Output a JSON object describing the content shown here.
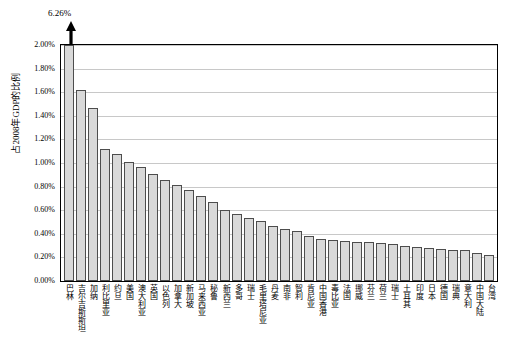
{
  "chart_data": {
    "type": "bar",
    "title": "",
    "xlabel": "",
    "ylabel": "占2008年GDP的比例",
    "ylim": [
      0,
      0.02
    ],
    "grid": true,
    "legend": null,
    "y_ticks": [
      "0.00%",
      "0.20%",
      "0.40%",
      "0.60%",
      "0.80%",
      "1.00%",
      "1.20%",
      "1.40%",
      "1.60%",
      "1.80%",
      "2.00%"
    ],
    "y_tick_values": [
      0,
      0.002,
      0.004,
      0.006,
      0.008,
      0.01,
      0.012,
      0.014,
      0.016,
      0.018,
      0.02
    ],
    "annotations": [
      {
        "text": "6.26%",
        "target_category": "巴林",
        "note": "bar truncated by axis maximum, arrow points up"
      }
    ],
    "categories": [
      "巴林",
      "吉尔吉斯斯坦",
      "加纳",
      "利比里亚",
      "约旦",
      "美国",
      "澳大利亚",
      "英国",
      "以色列",
      "加拿大",
      "新加坡",
      "马来西亚",
      "秘鲁",
      "新西兰",
      "多哥",
      "瑞士",
      "毛里塔尼亚",
      "丹麦",
      "南非",
      "智利",
      "肯尼亚",
      "中国香港",
      "毒比亚",
      "法国",
      "挪威",
      "芬兰",
      "荷兰",
      "瑞士",
      "土耳其",
      "印度",
      "日本",
      "德国",
      "瑞典",
      "意大利",
      "中国大陆",
      "台湾"
    ],
    "values": [
      0.0626,
      0.0162,
      0.0147,
      0.0112,
      0.0108,
      0.0101,
      0.0097,
      0.0091,
      0.0086,
      0.0081,
      0.0077,
      0.0072,
      0.0067,
      0.006,
      0.0057,
      0.0053,
      0.0051,
      0.0047,
      0.0044,
      0.0042,
      0.0038,
      0.0036,
      0.0035,
      0.0034,
      0.0033,
      0.0033,
      0.0032,
      0.0031,
      0.003,
      0.0029,
      0.0028,
      0.0027,
      0.0026,
      0.0026,
      0.0024,
      0.0022
    ],
    "value_labels": [
      "6.26%",
      "1.62%",
      "1.47%",
      "1.12%",
      "1.08%",
      "1.01%",
      "0.97%",
      "0.91%",
      "0.86%",
      "0.81%",
      "0.77%",
      "0.72%",
      "0.67%",
      "0.60%",
      "0.57%",
      "0.53%",
      "0.51%",
      "0.47%",
      "0.44%",
      "0.42%",
      "0.38%",
      "0.36%",
      "0.35%",
      "0.34%",
      "0.33%",
      "0.33%",
      "0.32%",
      "0.31%",
      "0.30%",
      "0.29%",
      "0.28%",
      "0.27%",
      "0.26%",
      "0.26%",
      "0.24%",
      "0.22%"
    ],
    "colors": {
      "bar_fill": "#d9d9d9",
      "bar_border": "#4d4d4d",
      "gridline": "#c8c8c8",
      "axis": "#000000",
      "text": "#000000"
    }
  }
}
